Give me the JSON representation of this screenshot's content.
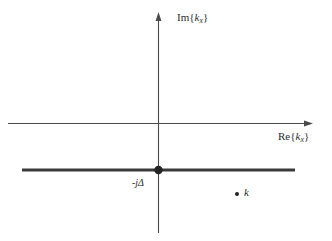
{
  "figure": {
    "background_color": "#ffffff",
    "line_color": "#4a4a4a",
    "thick_line_color": "#3a3a3a",
    "text_color": "#2b2b2b",
    "width": 332,
    "height": 241
  },
  "axes": {
    "vertical": {
      "label_prefix": "Im",
      "label_open": "{",
      "label_var": "k",
      "label_sub": "x",
      "label_close": "}",
      "label_full": "Im{k_x}",
      "x": 158,
      "y_top": 13,
      "y_bottom": 233,
      "arrow": "up"
    },
    "horizontal": {
      "label_prefix": "Re",
      "label_open": "{",
      "label_var": "k",
      "label_sub": "x",
      "label_close": "}",
      "label_full": "Re{k_x}",
      "y": 123,
      "x_left": 8,
      "x_right": 312,
      "arrow": "right"
    }
  },
  "features": {
    "branch_cut": {
      "name": "branch-cut-line",
      "y": 170,
      "x_start": 22,
      "x_end": 295,
      "thickness": 3,
      "label": "-jΔ"
    },
    "branch_point": {
      "name": "branch-point-marker",
      "x": 158,
      "y": 170,
      "radius": 4.2,
      "label": "-jΔ"
    },
    "pole": {
      "name": "pole-marker",
      "x": 237,
      "y": 194,
      "radius": 2.0,
      "label": "k"
    }
  }
}
